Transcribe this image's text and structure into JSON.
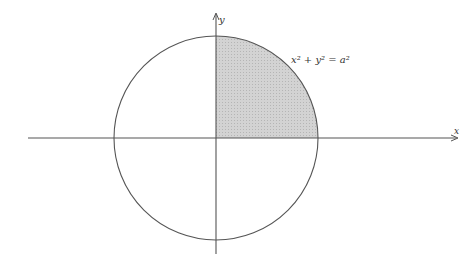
{
  "diagram": {
    "type": "circle-quadrant",
    "equation_label": "x² + y² = a²",
    "x_axis_label": "x",
    "y_axis_label": "y",
    "shaded_region": "first quadrant of circle",
    "colors": {
      "stroke": "#555555",
      "shade": "#cfcfcf"
    }
  }
}
